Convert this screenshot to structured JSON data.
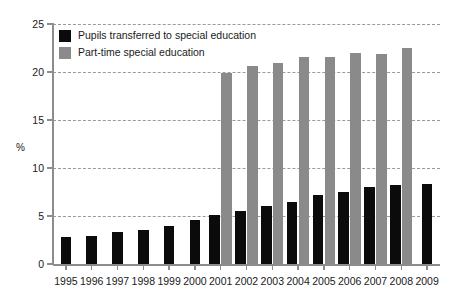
{
  "chart_data": {
    "type": "bar",
    "title": "",
    "subtitle": "",
    "xlabel": "",
    "ylabel": "%",
    "ylim": [
      0,
      25
    ],
    "yticks": [
      0,
      5,
      10,
      15,
      20,
      25
    ],
    "ytick_labels": [
      "0",
      "5",
      "10",
      "15",
      "20",
      "25"
    ],
    "grid": true,
    "grid_axis": "y",
    "grid_style": "dashed",
    "legend_position": "upper-left",
    "categories": [
      "1995",
      "1996",
      "1997",
      "1998",
      "1999",
      "2000",
      "2001",
      "2002",
      "2003",
      "2004",
      "2005",
      "2006",
      "2007",
      "2008",
      "2009"
    ],
    "series": [
      {
        "name": "Pupils transferred to special education",
        "color": "#0b0b0b",
        "values": [
          2.8,
          2.9,
          3.3,
          3.5,
          4.0,
          4.6,
          5.1,
          5.5,
          6.0,
          6.5,
          7.2,
          7.5,
          8.0,
          8.2,
          8.3
        ]
      },
      {
        "name": "Part-time special education",
        "color": "#8a8a8a",
        "values": [
          null,
          null,
          null,
          null,
          null,
          null,
          19.9,
          20.6,
          20.9,
          21.6,
          21.6,
          22.0,
          21.9,
          22.5,
          null
        ]
      }
    ]
  },
  "legend": {
    "items": [
      {
        "label": "Pupils transferred to special education",
        "swatch": "black"
      },
      {
        "label": "Part-time special education",
        "swatch": "gray"
      }
    ]
  },
  "axis": {
    "y_title": "%"
  },
  "colors": {
    "series_black": "#0b0b0b",
    "series_gray": "#8a8a8a",
    "axis": "#8d8d8d",
    "grid": "#9a9a9a",
    "background": "#ffffff"
  }
}
